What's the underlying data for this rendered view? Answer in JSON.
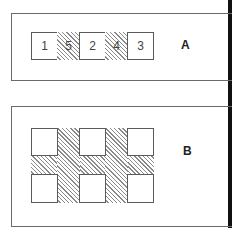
{
  "panels": [
    {
      "label": "A",
      "cells": [
        "1",
        "5",
        "2",
        "4",
        "3"
      ],
      "hatched_cells": [
        "5",
        "4"
      ]
    },
    {
      "label": "B",
      "grid": {
        "rows": 2,
        "cols": 3
      },
      "hatched_region": "space between squares"
    }
  ],
  "colors": {
    "line": "#6a6a6a",
    "hatch": "#8a8a8a",
    "edge": "#111111"
  }
}
